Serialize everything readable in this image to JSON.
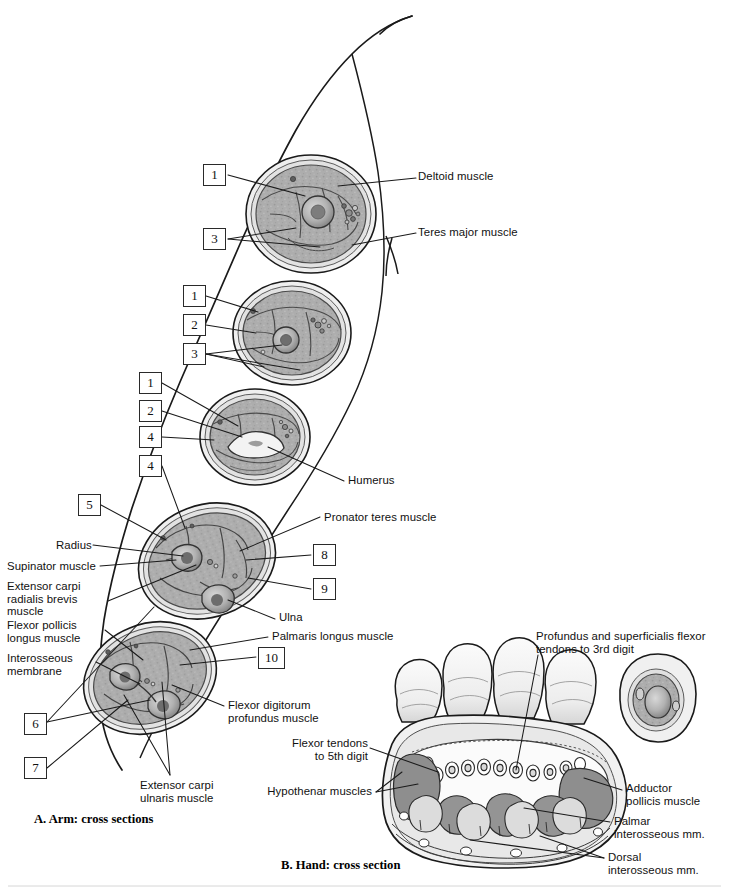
{
  "figure": {
    "panels": [
      {
        "id": "A",
        "caption": "A. Arm: cross sections"
      },
      {
        "id": "B",
        "caption": "B. Hand: cross section"
      }
    ]
  },
  "arm_panel": {
    "number_boxes": [
      {
        "n": "1",
        "x": 203,
        "y": 164,
        "group": "section-1-deltoid-level"
      },
      {
        "n": "3",
        "x": 203,
        "y": 228,
        "group": "section-1-deltoid-level"
      },
      {
        "n": "1",
        "x": 183,
        "y": 285,
        "group": "section-2-mid-arm"
      },
      {
        "n": "2",
        "x": 183,
        "y": 314,
        "group": "section-2-mid-arm"
      },
      {
        "n": "3",
        "x": 183,
        "y": 343,
        "group": "section-2-mid-arm"
      },
      {
        "n": "1",
        "x": 139,
        "y": 372,
        "group": "section-3-distal-arm"
      },
      {
        "n": "2",
        "x": 139,
        "y": 400,
        "group": "section-3-distal-arm"
      },
      {
        "n": "4",
        "x": 139,
        "y": 426,
        "group": "section-3-distal-arm"
      },
      {
        "n": "4",
        "x": 139,
        "y": 455,
        "group": "section-4-proximal-forearm"
      },
      {
        "n": "5",
        "x": 78,
        "y": 494,
        "group": "section-4-proximal-forearm"
      },
      {
        "n": "8",
        "x": 313,
        "y": 544,
        "group": "section-4-proximal-forearm"
      },
      {
        "n": "9",
        "x": 313,
        "y": 578,
        "group": "section-4-proximal-forearm"
      },
      {
        "n": "10",
        "x": 258,
        "y": 647,
        "group": "section-5-distal-forearm"
      },
      {
        "n": "6",
        "x": 24,
        "y": 713,
        "group": "section-5-distal-forearm"
      },
      {
        "n": "7",
        "x": 24,
        "y": 757,
        "group": "section-5-distal-forearm"
      }
    ],
    "labels_right": [
      {
        "text": "Deltoid muscle",
        "x": 418,
        "y": 175
      },
      {
        "text": "Teres major muscle",
        "x": 418,
        "y": 229
      },
      {
        "text": "Humerus",
        "x": 345,
        "y": 477
      },
      {
        "text": "Pronator teres muscle",
        "x": 322,
        "y": 514
      },
      {
        "text": "Ulna",
        "x": 277,
        "y": 615
      },
      {
        "text": "Palmaris longus muscle",
        "x": 270,
        "y": 633
      },
      {
        "text": "Flexor digitorum\nprofundus muscle",
        "x": 226,
        "y": 702
      },
      {
        "text": "Extensor carpi\nulnaris muscle",
        "x": 138,
        "y": 782
      }
    ],
    "labels_left": [
      {
        "text": "Radius",
        "x": 56,
        "y": 542
      },
      {
        "text": "Supinator muscle",
        "x": 7,
        "y": 563
      },
      {
        "text": "Extensor carpi\nradialis brevis\nmuscle",
        "x": 7,
        "y": 583
      },
      {
        "text": "Flexor pollicis\nlongus muscle",
        "x": 7,
        "y": 622
      },
      {
        "text": "Interosseous\nmembrane",
        "x": 7,
        "y": 655
      }
    ]
  },
  "hand_panel": {
    "labels_left": [
      {
        "text": "Flexor tendons\nto 5th digit",
        "x": 310,
        "y": 740
      },
      {
        "text": "Hypothenar muscles",
        "x": 258,
        "y": 788
      }
    ],
    "labels_right": [
      {
        "text": "Profundus and superficialis flexor\ntendons to 3rd digit",
        "x": 536,
        "y": 633
      },
      {
        "text": "Adductor\npollicis muscle",
        "x": 626,
        "y": 785
      },
      {
        "text": "Palmar\ninterosseous mm.",
        "x": 614,
        "y": 818
      },
      {
        "text": "Dorsal\ninterosseous mm.",
        "x": 608,
        "y": 855
      }
    ]
  },
  "colors": {
    "ink": "#111111",
    "leader_line": "#1a1a1a",
    "tissue_fill": "#a9a9a9",
    "tissue_fill_light": "#c9c9c9",
    "skin_fill": "#efefef",
    "bone_fill": "#8a8a8a",
    "muscle_dark": "#8e8e8e",
    "outline": "#2a2a2a",
    "box_border": "#2a2a2a",
    "page_bg": "#ffffff"
  }
}
